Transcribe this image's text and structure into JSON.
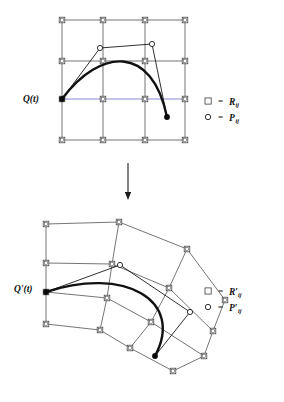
{
  "figure": {
    "background_color": "#ffffff",
    "width": 284,
    "height": 402,
    "colors": {
      "grid": "#3b3b3b",
      "hull": "#1a1a1a",
      "curve": "#111111",
      "highlight_axis": "#8a8ad8",
      "node_fill": "#ffffff",
      "dot": "#0b0b0b"
    }
  },
  "panels": [
    {
      "id": "undeformed",
      "name": "undeformed-lattice-panel",
      "curve_label": "Q(t)",
      "curve_label_pos": {
        "x": 23,
        "y": 102
      },
      "lattice": {
        "rows": 4,
        "cols": 4,
        "type": "regular-grid",
        "nodes": [
          [
            {
              "x": 62,
              "y": 20
            },
            {
              "x": 103,
              "y": 20
            },
            {
              "x": 145,
              "y": 20
            },
            {
              "x": 185,
              "y": 20
            }
          ],
          [
            {
              "x": 62,
              "y": 61
            },
            {
              "x": 103,
              "y": 61
            },
            {
              "x": 145,
              "y": 61
            },
            {
              "x": 185,
              "y": 61
            }
          ],
          [
            {
              "x": 62,
              "y": 99
            },
            {
              "x": 103,
              "y": 99
            },
            {
              "x": 145,
              "y": 99
            },
            {
              "x": 185,
              "y": 99
            }
          ],
          [
            {
              "x": 62,
              "y": 140
            },
            {
              "x": 103,
              "y": 140
            },
            {
              "x": 145,
              "y": 140
            },
            {
              "x": 185,
              "y": 140
            }
          ]
        ],
        "highlight_row_index": 2
      },
      "control_polygon": [
        {
          "x": 62,
          "y": 99,
          "marker": "dot"
        },
        {
          "x": 100,
          "y": 48,
          "marker": "circle"
        },
        {
          "x": 152,
          "y": 44,
          "marker": "circle"
        },
        {
          "x": 167,
          "y": 117,
          "marker": "dot"
        }
      ],
      "curve": {
        "start": {
          "x": 62,
          "y": 99
        },
        "c1": {
          "x": 100,
          "y": 48
        },
        "c2": {
          "x": 152,
          "y": 44
        },
        "end": {
          "x": 167,
          "y": 117
        }
      }
    },
    {
      "id": "deformed",
      "name": "deformed-lattice-panel",
      "curve_label": "Q'(t)",
      "curve_label_pos": {
        "x": 14,
        "y": 292
      },
      "lattice": {
        "rows": 4,
        "cols": 4,
        "type": "warped-grid",
        "nodes": [
          [
            {
              "x": 46,
              "y": 224
            },
            {
              "x": 119,
              "y": 222
            },
            {
              "x": 187,
              "y": 249
            },
            {
              "x": 225,
              "y": 300
            }
          ],
          [
            {
              "x": 46,
              "y": 263
            },
            {
              "x": 112,
              "y": 264
            },
            {
              "x": 169,
              "y": 288
            },
            {
              "x": 213,
              "y": 331
            }
          ],
          [
            {
              "x": 46,
              "y": 292
            },
            {
              "x": 107,
              "y": 298
            },
            {
              "x": 151,
              "y": 322
            },
            {
              "x": 204,
              "y": 356
            }
          ],
          [
            {
              "x": 46,
              "y": 324
            },
            {
              "x": 100,
              "y": 330
            },
            {
              "x": 130,
              "y": 348
            },
            {
              "x": 173,
              "y": 371
            }
          ]
        ]
      },
      "control_polygon": [
        {
          "x": 46,
          "y": 292,
          "marker": "dot"
        },
        {
          "x": 120,
          "y": 265,
          "marker": "circle"
        },
        {
          "x": 190,
          "y": 312,
          "marker": "circle"
        },
        {
          "x": 155,
          "y": 356,
          "marker": "dot"
        }
      ],
      "curve": {
        "start": {
          "x": 46,
          "y": 292
        },
        "c1": {
          "x": 124,
          "y": 266
        },
        "c2": {
          "x": 185,
          "y": 300
        },
        "end": {
          "x": 155,
          "y": 356
        }
      }
    }
  ],
  "arrow": {
    "name": "transformation-arrow",
    "x": 128,
    "y_start": 163,
    "y_end": 200
  },
  "legends": [
    {
      "id": "legend-top",
      "name": "legend-undeformed",
      "x": 208,
      "y": 101,
      "rows": [
        {
          "marker": "square",
          "equals": "=",
          "symbol": "R",
          "prime": "",
          "subscript": "ij"
        },
        {
          "marker": "circle",
          "equals": "=",
          "symbol": "P",
          "prime": "",
          "subscript": "ij"
        }
      ]
    },
    {
      "id": "legend-bottom",
      "name": "legend-deformed",
      "x": 208,
      "y": 291,
      "rows": [
        {
          "marker": "square",
          "equals": "=",
          "symbol": "R",
          "prime": "′",
          "subscript": "ij"
        },
        {
          "marker": "circle",
          "equals": "=",
          "symbol": "P",
          "prime": "′",
          "subscript": "ij"
        }
      ]
    }
  ]
}
